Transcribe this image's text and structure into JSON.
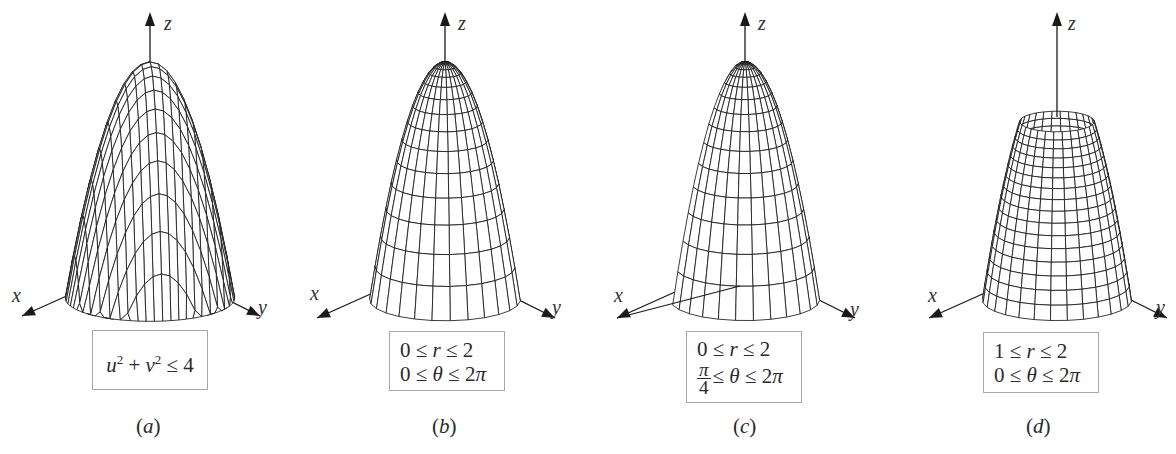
{
  "figure": {
    "colors": {
      "mesh": "#1a1a1a",
      "axis": "#1a1a1a",
      "box_border": "#a8a8a8",
      "background": "#ffffff"
    },
    "axes_labels": {
      "x": "x",
      "y": "y",
      "z": "z"
    },
    "panels": [
      {
        "id": "a",
        "label": "(a)",
        "label_letter": "a",
        "domain_lines": [
          "u² + v² ≤ 4"
        ],
        "parametrization": "cartesian",
        "grid": "u,v rectangular grid lines",
        "center_x": 150,
        "apex_y": 62,
        "base_y": 298,
        "radius_px": 118
      },
      {
        "id": "b",
        "label": "(b)",
        "label_letter": "b",
        "domain_lines": [
          "0 ≤ r ≤ 2",
          "0 ≤ θ ≤ 2π"
        ],
        "parametrization": "polar",
        "r_min": 0,
        "r_max": 2,
        "theta_min_deg": 0,
        "theta_max_deg": 360,
        "center_x": 445,
        "apex_y": 62,
        "base_y": 300,
        "radius_px": 105
      },
      {
        "id": "c",
        "label": "(c)",
        "label_letter": "c",
        "domain_lines": [
          "0 ≤ r ≤ 2",
          "π/4 ≤ θ ≤ 2π"
        ],
        "domain_fraction": {
          "numerator": "π",
          "denominator": "4",
          "rest": "≤ θ ≤ 2π"
        },
        "parametrization": "polar",
        "r_min": 0,
        "r_max": 2,
        "theta_min_deg": 45,
        "theta_max_deg": 360,
        "center_x": 745,
        "apex_y": 62,
        "base_y": 300,
        "radius_px": 104
      },
      {
        "id": "d",
        "label": "(d)",
        "label_letter": "d",
        "domain_lines": [
          "1 ≤ r ≤ 2",
          "0 ≤ θ ≤ 2π"
        ],
        "parametrization": "polar",
        "r_min": 1,
        "r_max": 2,
        "theta_min_deg": 0,
        "theta_max_deg": 360,
        "center_x": 1057,
        "apex_y": 62,
        "base_y": 300,
        "radius_px": 104
      }
    ]
  }
}
